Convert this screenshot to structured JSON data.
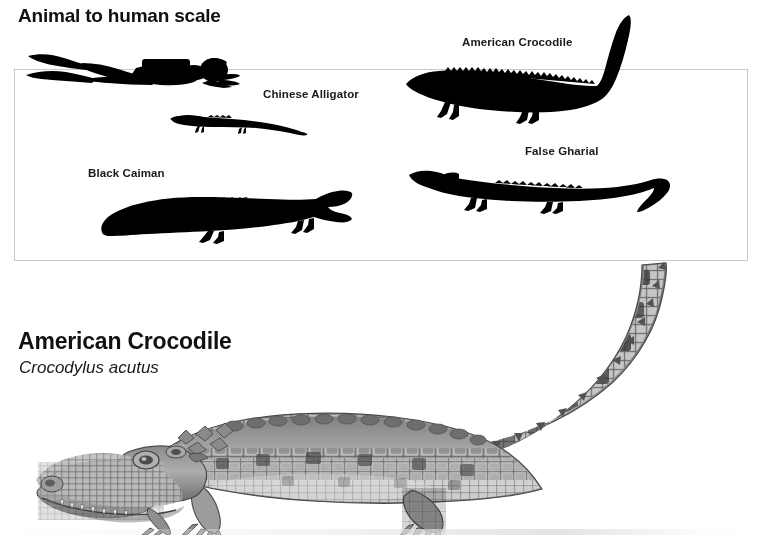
{
  "page": {
    "background_color": "#ffffff",
    "text_color": "#1a1a1a"
  },
  "scale_panel": {
    "title": "Animal to human scale",
    "box_border_color": "#c9c9c9",
    "silhouette_color": "#000000",
    "items": [
      {
        "label": "Scuba Diver",
        "label_visible": false,
        "name": "diver"
      },
      {
        "label": "Chinese Alligator",
        "label_visible": true,
        "name": "chinese-alligator"
      },
      {
        "label": "American Crocodile",
        "label_visible": true,
        "name": "american-crocodile"
      },
      {
        "label": "Black Caiman",
        "label_visible": true,
        "name": "black-caiman"
      },
      {
        "label": "False Gharial",
        "label_visible": true,
        "name": "false-gharial"
      }
    ],
    "labels": {
      "chinese_alligator": "Chinese Alligator",
      "american_crocodile": "American Crocodile",
      "black_caiman": "Black Caiman",
      "false_gharial": "False Gharial"
    }
  },
  "feature": {
    "common_name": "American Crocodile",
    "scientific_name": "Crocodylus acutus",
    "illustration_name": "american-crocodile-illustration",
    "illustration_style": "grayscale-stipple-drawing"
  }
}
